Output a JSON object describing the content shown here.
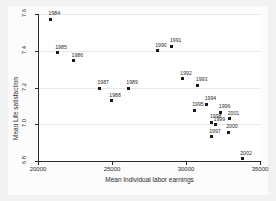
{
  "chart_data": {
    "type": "scatter",
    "title": "",
    "xlabel": "Mean Individual labor earnings",
    "ylabel": "Mean Life satisfaction",
    "xlim": [
      20000,
      35000
    ],
    "ylim": [
      6.8,
      7.6
    ],
    "xticks": [
      20000,
      25000,
      30000,
      35000
    ],
    "xtick_labels": [
      "20000",
      "25000",
      "30000",
      "35000"
    ],
    "yticks": [
      6.8,
      7.0,
      7.2,
      7.4,
      7.6
    ],
    "ytick_labels": [
      "6.8",
      "7.0",
      "7.2",
      "7.4",
      "7.6"
    ],
    "grid": "horizontal",
    "legend": "none",
    "marker_color": "#1a1a1a",
    "points": [
      {
        "label": "1984",
        "x": 20850,
        "y": 7.572
      },
      {
        "label": "1985",
        "x": 21300,
        "y": 7.39
      },
      {
        "label": "1986",
        "x": 22400,
        "y": 7.345
      },
      {
        "label": "1987",
        "x": 24150,
        "y": 7.196
      },
      {
        "label": "1988",
        "x": 24950,
        "y": 7.128
      },
      {
        "label": "1989",
        "x": 26100,
        "y": 7.196
      },
      {
        "label": "1990",
        "x": 28050,
        "y": 7.4
      },
      {
        "label": "1991",
        "x": 29050,
        "y": 7.424
      },
      {
        "label": "1992",
        "x": 29750,
        "y": 7.247
      },
      {
        "label": "1993",
        "x": 30800,
        "y": 7.213
      },
      {
        "label": "1994",
        "x": 31400,
        "y": 7.11
      },
      {
        "label": "1995",
        "x": 30550,
        "y": 7.076
      },
      {
        "label": "1996",
        "x": 32350,
        "y": 7.066
      },
      {
        "label": "1997",
        "x": 31700,
        "y": 6.932
      },
      {
        "label": "1998",
        "x": 31750,
        "y": 7.012
      },
      {
        "label": "1999",
        "x": 32000,
        "y": 6.996
      },
      {
        "label": "2000",
        "x": 32850,
        "y": 6.956
      },
      {
        "label": "2001",
        "x": 32950,
        "y": 7.03
      },
      {
        "label": "2002",
        "x": 33800,
        "y": 6.812
      }
    ]
  }
}
